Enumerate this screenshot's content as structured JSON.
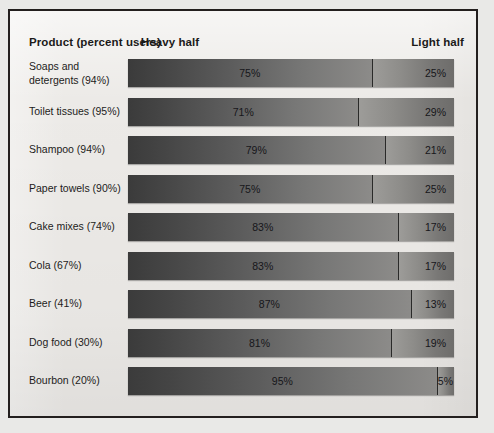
{
  "figure": {
    "header": {
      "product": "Product (percent users)",
      "heavy": "Heavy half",
      "light": "Light half"
    }
  },
  "chart_data": {
    "type": "bar",
    "subtype": "stacked-horizontal-100",
    "title": "",
    "xlabel": "",
    "ylabel": "",
    "xlim": [
      0,
      100
    ],
    "grid": false,
    "legend_position": "top",
    "categories": [
      "Soaps and detergents (94%)",
      "Toilet tissues (95%)",
      "Shampoo (94%)",
      "Paper towels (90%)",
      "Cake mixes (74%)",
      "Cola (67%)",
      "Beer (41%)",
      "Dog food (30%)",
      "Bourbon (20%)"
    ],
    "series": [
      {
        "name": "Heavy half",
        "values": [
          75,
          71,
          79,
          75,
          83,
          83,
          87,
          81,
          95
        ]
      },
      {
        "name": "Light half",
        "values": [
          25,
          29,
          21,
          25,
          17,
          17,
          13,
          19,
          5
        ]
      }
    ],
    "rows": [
      {
        "label": "Soaps and\ndetergents (94%)",
        "heavy": 75,
        "light": 25,
        "heavy_label": "75%",
        "light_label": "25%"
      },
      {
        "label": "Toilet tissues (95%)",
        "heavy": 71,
        "light": 29,
        "heavy_label": "71%",
        "light_label": "29%"
      },
      {
        "label": "Shampoo (94%)",
        "heavy": 79,
        "light": 21,
        "heavy_label": "79%",
        "light_label": "21%"
      },
      {
        "label": "Paper towels (90%)",
        "heavy": 75,
        "light": 25,
        "heavy_label": "75%",
        "light_label": "25%"
      },
      {
        "label": "Cake mixes (74%)",
        "heavy": 83,
        "light": 17,
        "heavy_label": "83%",
        "light_label": "17%"
      },
      {
        "label": "Cola (67%)",
        "heavy": 83,
        "light": 17,
        "heavy_label": "83%",
        "light_label": "17%"
      },
      {
        "label": "Beer (41%)",
        "heavy": 87,
        "light": 13,
        "heavy_label": "87%",
        "light_label": "13%"
      },
      {
        "label": "Dog food (30%)",
        "heavy": 81,
        "light": 19,
        "heavy_label": "81%",
        "light_label": "19%"
      },
      {
        "label": "Bourbon (20%)",
        "heavy": 95,
        "light": 5,
        "heavy_label": "95%",
        "light_label": "5%"
      }
    ],
    "colors": {
      "heavy_dark": "#3b3b3b",
      "heavy_light": "#8c8b89",
      "light_dark": "#6e6d6b",
      "light_light": "#9d9c99",
      "frame": "#231f1e",
      "background": "#eceae7",
      "text": "#1b1a19"
    }
  }
}
